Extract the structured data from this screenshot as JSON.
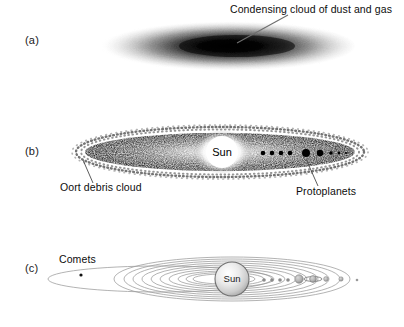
{
  "figure": {
    "background_color": "#ffffff",
    "ink_color": "#000000"
  },
  "panels": [
    {
      "id": "a",
      "label": "(a)",
      "caption_stage": "Condensing nebula",
      "annotations": [
        {
          "name": "condensing-cloud",
          "text": "Condensing cloud of dust and gas",
          "text_x": 230,
          "text_y": 10,
          "leader": {
            "x1": 288,
            "y1": 15,
            "x2": 237,
            "y2": 43
          }
        }
      ],
      "cloud": {
        "cx": 225,
        "cy": 46,
        "rx": 130,
        "ry": 25,
        "core_offset_x": 12,
        "core_darkness": "#000000",
        "edge_color": "#ffffff"
      }
    },
    {
      "id": "b",
      "label": "(b)",
      "caption_stage": "Flattened disk with protoplanets",
      "sun": {
        "name": "Sun",
        "label": "Sun",
        "cx": 222,
        "cy": 152,
        "r": 16,
        "glow_r": 30
      },
      "disk": {
        "cx": 220,
        "cy": 152,
        "rx": 135,
        "ry": 19
      },
      "protoplanets": [
        {
          "cx": 263,
          "cy": 153,
          "r": 2.3
        },
        {
          "cx": 272,
          "cy": 153,
          "r": 2.3
        },
        {
          "cx": 281,
          "cy": 153,
          "r": 2.3
        },
        {
          "cx": 290,
          "cy": 153,
          "r": 2.3
        },
        {
          "cx": 306,
          "cy": 153,
          "r": 4.0
        },
        {
          "cx": 320,
          "cy": 153,
          "r": 3.2
        },
        {
          "cx": 331,
          "cy": 153,
          "r": 1.8
        },
        {
          "cx": 339,
          "cy": 153,
          "r": 1.4
        },
        {
          "cx": 346,
          "cy": 153,
          "r": 1.1
        }
      ],
      "annotations": [
        {
          "name": "oort-debris-cloud",
          "text": "Oort debris cloud",
          "text_x": 60,
          "text_y": 186,
          "leader": {
            "x1": 93,
            "y1": 183,
            "x2": 83,
            "y2": 162
          }
        },
        {
          "name": "protoplanets",
          "text": "Protoplanets",
          "text_x": 296,
          "text_y": 190,
          "leader": {
            "x1": 318,
            "y1": 187,
            "x2": 306,
            "y2": 160
          }
        }
      ]
    },
    {
      "id": "c",
      "label": "(c)",
      "caption_stage": "Present-day solar system with orbits",
      "sun": {
        "name": "Sun",
        "label": "Sun",
        "cx": 232,
        "cy": 279,
        "r": 17
      },
      "comet": {
        "name": "comet",
        "cx": 81,
        "cy": 275,
        "r": 1.6
      },
      "annotations": [
        {
          "name": "comets",
          "text": "Comets",
          "text_x": 59,
          "text_y": 258
        }
      ],
      "orbits": [
        {
          "cx": 160,
          "cy": 279,
          "rx": 112,
          "ry": 13
        },
        {
          "cx": 232,
          "cy": 279,
          "rx": 118,
          "ry": 22
        },
        {
          "cx": 232,
          "cy": 279,
          "rx": 108,
          "ry": 20
        },
        {
          "cx": 231,
          "cy": 279,
          "rx": 98,
          "ry": 18
        },
        {
          "cx": 230,
          "cy": 279,
          "rx": 88,
          "ry": 16
        },
        {
          "cx": 229,
          "cy": 279,
          "rx": 78,
          "ry": 14
        },
        {
          "cx": 228,
          "cy": 279,
          "rx": 68,
          "ry": 12
        },
        {
          "cx": 227,
          "cy": 279,
          "rx": 58,
          "ry": 10
        },
        {
          "cx": 226,
          "cy": 279,
          "rx": 48,
          "ry": 8
        },
        {
          "cx": 225,
          "cy": 279,
          "rx": 39,
          "ry": 6.5
        },
        {
          "cx": 224,
          "cy": 279,
          "rx": 31,
          "ry": 5
        }
      ],
      "planets": [
        {
          "cx": 264,
          "cy": 280,
          "r": 1.8,
          "ring": false
        },
        {
          "cx": 272,
          "cy": 280,
          "r": 1.8,
          "ring": false
        },
        {
          "cx": 280,
          "cy": 280,
          "r": 1.8,
          "ring": false
        },
        {
          "cx": 288,
          "cy": 280,
          "r": 1.8,
          "ring": false
        },
        {
          "cx": 299,
          "cy": 279,
          "r": 4.2,
          "ring": false
        },
        {
          "cx": 313,
          "cy": 279,
          "r": 3.4,
          "ring": true
        },
        {
          "cx": 326,
          "cy": 279,
          "r": 2.4,
          "ring": false
        },
        {
          "cx": 341,
          "cy": 279,
          "r": 2.2,
          "ring": false
        },
        {
          "cx": 357,
          "cy": 280,
          "r": 1.3,
          "ring": false
        }
      ]
    }
  ]
}
